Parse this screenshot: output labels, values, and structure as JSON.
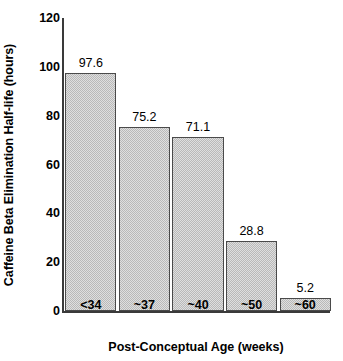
{
  "chart_data": {
    "type": "bar",
    "title": "",
    "categories": [
      "<34",
      "~37",
      "~40",
      "~50",
      "~60"
    ],
    "values": [
      97.6,
      75.2,
      71.1,
      28.8,
      5.2
    ],
    "value_labels": [
      "97.6",
      "75.2",
      "71.1",
      "28.8",
      "5.2"
    ],
    "xlabel": "Post-Conceptual Age (weeks)",
    "ylabel": "Caffeine Beta Elimination Half-life (hours)",
    "ylim": [
      0,
      120
    ],
    "yticks": [
      0,
      20,
      40,
      60,
      80,
      100,
      120
    ],
    "ytick_labels": [
      "0",
      "20",
      "40",
      "60",
      "80",
      "100",
      "120"
    ],
    "grid": false,
    "legend": false,
    "bar_fill_color": "#b9b9b9",
    "bar_edge_color": "#4a4a4a",
    "axis_color": "#3a3a3a",
    "text_color": "#000000"
  }
}
